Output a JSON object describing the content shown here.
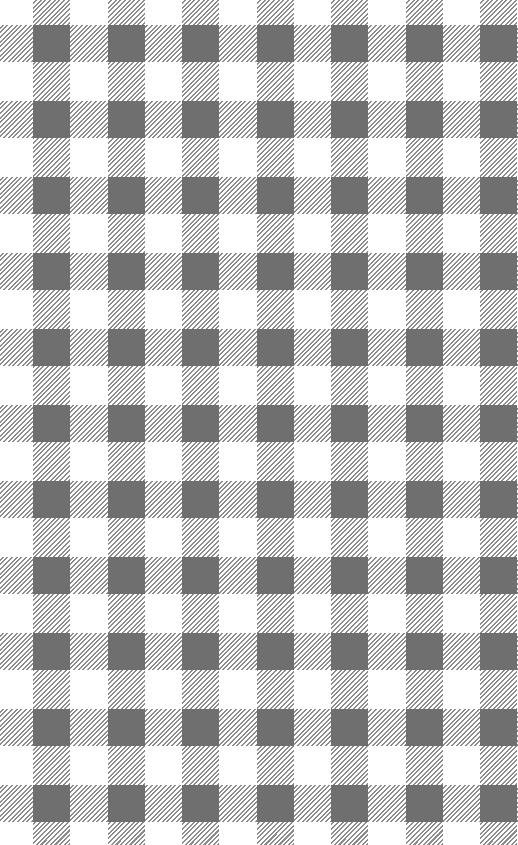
{
  "pattern": {
    "name": "gingham check",
    "colors": {
      "background": "#ffffff",
      "hatch": "#8c8c8c",
      "overlap": "#6f6f6f"
    },
    "vertical_stripes": {
      "start": 33,
      "period": 74.5,
      "width": 37,
      "count": 7
    },
    "horizontal_stripes": {
      "start": 25,
      "period": 76,
      "width": 37,
      "count": 11
    }
  }
}
